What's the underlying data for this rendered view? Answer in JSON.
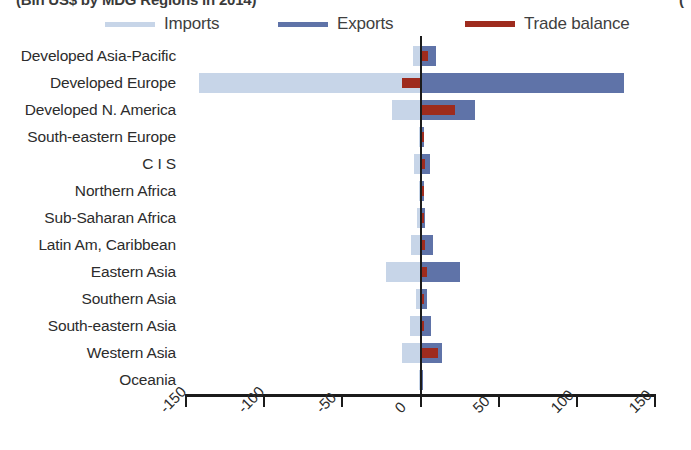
{
  "title": "(Bln US$ by MDG Regions in 2014)",
  "title_right_fragment": "(",
  "legend": {
    "items": [
      {
        "label": "Imports",
        "color": "#c7d5e8",
        "name": "imports"
      },
      {
        "label": "Exports",
        "color": "#5f73a8",
        "name": "exports"
      },
      {
        "label": "Trade balance",
        "color": "#9e2b1e",
        "name": "trade-balance"
      }
    ]
  },
  "colors": {
    "imports": "#c7d5e8",
    "exports": "#5f73a8",
    "trade_balance": "#9e2b1e",
    "axis": "#1b1b1b",
    "text": "#2c2c2c"
  },
  "chart_data": {
    "type": "bar",
    "orientation": "horizontal",
    "title": "(Bln US$ by MDG Regions in 2014)",
    "xlabel": "",
    "ylabel": "",
    "xlim": [
      -150,
      150
    ],
    "xticks": [
      -150,
      -100,
      -50,
      0,
      50,
      100,
      150
    ],
    "xticklabels": [
      "-150",
      "-100",
      "-50",
      "0",
      "50",
      "100",
      "150"
    ],
    "grid": false,
    "legend_position": "top",
    "categories": [
      "Developed Asia-Pacific",
      "Developed Europe",
      "Developed N. America",
      "South-eastern Europe",
      "C I S",
      "Northern Africa",
      "Sub-Saharan Africa",
      "Latin Am, Caribbean",
      "Eastern Asia",
      "Southern Asia",
      "South-eastern Asia",
      "Western Asia",
      "Oceania"
    ],
    "series": [
      {
        "name": "Imports",
        "color": "#c7d5e8",
        "values": [
          -5,
          -142,
          -18,
          -1,
          -4,
          -1,
          -2,
          -6,
          -22,
          -3,
          -7,
          -12,
          -1
        ]
      },
      {
        "name": "Exports",
        "color": "#5f73a8",
        "values": [
          10,
          130,
          35,
          2,
          6,
          2,
          3,
          8,
          25,
          4,
          7,
          14,
          1
        ]
      },
      {
        "name": "Trade balance",
        "color": "#9e2b1e",
        "values": [
          5,
          -12,
          22,
          1,
          3,
          1,
          1,
          3,
          4,
          1,
          1,
          11,
          0
        ]
      }
    ]
  }
}
